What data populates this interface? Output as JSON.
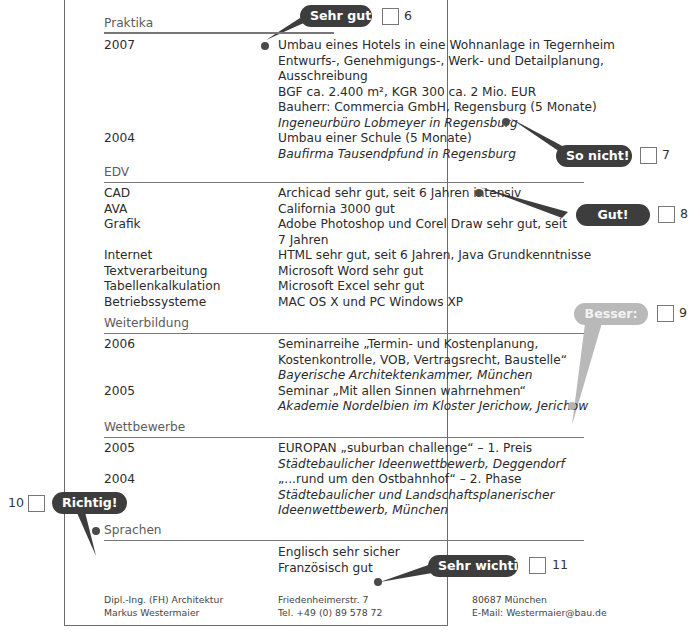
{
  "sections": {
    "praktika": {
      "title": "Praktika",
      "entries": [
        {
          "year": "2007",
          "lines": [
            "Umbau eines Hotels in eine Wohnanlage in Tegernheim",
            "Entwurfs-, Genehmigungs-, Werk- und Detailplanung,",
            "Ausschreibung",
            "BGF ca. 2.400 m², KGR 300 ca. 2 Mio. EUR",
            "Bauherr: Commercia GmbH, Regensburg (5 Monate)"
          ],
          "employer": "Ingeneurbüro Lobmeyer in Regensburg"
        },
        {
          "year": "2004",
          "lines": [
            "Umbau einer Schule (5 Monate)"
          ],
          "employer": "Baufirma Tausendpfund in Regensburg"
        }
      ]
    },
    "edv": {
      "title": "EDV",
      "rows": [
        {
          "label": "CAD",
          "value": "Archicad sehr gut, seit 6 Jahren intensiv"
        },
        {
          "label": "AVA",
          "value": "California 3000 gut"
        },
        {
          "label": "Grafik",
          "value": "Adobe Photoshop und Corel Draw sehr gut, seit",
          "value2": "7 Jahren"
        },
        {
          "label": "Internet",
          "value": "HTML sehr gut, seit 6 Jahren, Java Grundkenntnisse"
        },
        {
          "label": "Textverarbeitung",
          "value": "Microsoft Word sehr gut"
        },
        {
          "label": "Tabellenkalkulation",
          "value": "Microsoft Excel sehr gut"
        },
        {
          "label": "Betriebssysteme",
          "value": "MAC OS X und PC Windows XP"
        }
      ]
    },
    "weiterbildung": {
      "title": "Weiterbildung",
      "entries": [
        {
          "year": "2006",
          "lines": [
            "Seminarreihe „Termin- und Kostenplanung,",
            "Kostenkontrolle, VOB, Vertragsrecht, Baustelle“"
          ],
          "institution": "Bayerische Architektenkammer, München"
        },
        {
          "year": "2005",
          "lines": [
            "Seminar „Mit allen Sinnen wahrnehmen“"
          ],
          "institution": "Akademie Nordelbien im Kloster Jerichow, Jerichow"
        }
      ]
    },
    "wettbewerbe": {
      "title": "Wettbewerbe",
      "entries": [
        {
          "year": "2005",
          "lines": [
            "EUROPAN „suburban challenge“ – 1. Preis"
          ],
          "italic": [
            "Städtebaulicher Ideenwettbewerb, Deggendorf"
          ]
        },
        {
          "year": "2004",
          "lines": [
            "„...rund um den Ostbahnhof“ – 2. Phase"
          ],
          "italic": [
            "Städtebaulicher und Landschaftsplanerischer",
            "Ideenwettbewerb, München"
          ]
        }
      ]
    },
    "sprachen": {
      "title": "Sprachen",
      "lines": [
        "Englisch sehr sicher",
        "Französisch gut"
      ]
    }
  },
  "footer": {
    "col1": [
      "Dipl.-Ing. (FH) Architektur",
      "Markus Westermaier"
    ],
    "col2": [
      "Friedenheimerstr. 7",
      "Tel. +49 (0) 89 578 72"
    ],
    "col3": [
      "80687 München",
      "E-Mail: Westermaier@bau.de"
    ]
  },
  "annotations": [
    {
      "label": "Sehr gut!",
      "number": "6"
    },
    {
      "label": "So nicht!",
      "number": "7"
    },
    {
      "label": "Gut!",
      "number": "8"
    },
    {
      "label": "Besser:",
      "number": "9"
    },
    {
      "label": "Richtig!",
      "number": "10"
    },
    {
      "label": "Sehr wichtig!",
      "number": "11"
    }
  ],
  "colors": {
    "bubble_dark": "#3d3d3d",
    "bubble_light": "#b9b9b9",
    "rule": "#777777",
    "text": "#2b2b2b"
  }
}
